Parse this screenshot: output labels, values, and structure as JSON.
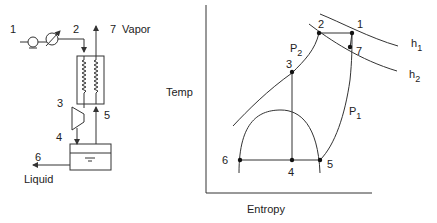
{
  "schematic": {
    "labels": {
      "s1": "1",
      "s2": "2",
      "s3": "3",
      "s4": "4",
      "s5": "5",
      "s6": "6",
      "s7": "7",
      "vapor": "Vapor",
      "liquid": "Liquid"
    },
    "components": [
      "compressor",
      "aftercooler",
      "heat-exchanger",
      "expansion-valve",
      "separator"
    ]
  },
  "ts_diagram": {
    "xlabel": "Entropy",
    "ylabel": "Temp",
    "points": {
      "p1": "1",
      "p2": "2",
      "p3": "3",
      "p4": "4",
      "p5": "5",
      "p6": "6",
      "p7": "7"
    },
    "isobars": {
      "P1": {
        "main": "P",
        "sub": "1"
      },
      "P2": {
        "main": "P",
        "sub": "2"
      }
    },
    "isenthalps": {
      "h1": {
        "main": "h",
        "sub": "1"
      },
      "h2": {
        "main": "h",
        "sub": "2"
      }
    }
  },
  "colors": {
    "line": "#333333",
    "text": "#222222",
    "background": "#ffffff"
  }
}
